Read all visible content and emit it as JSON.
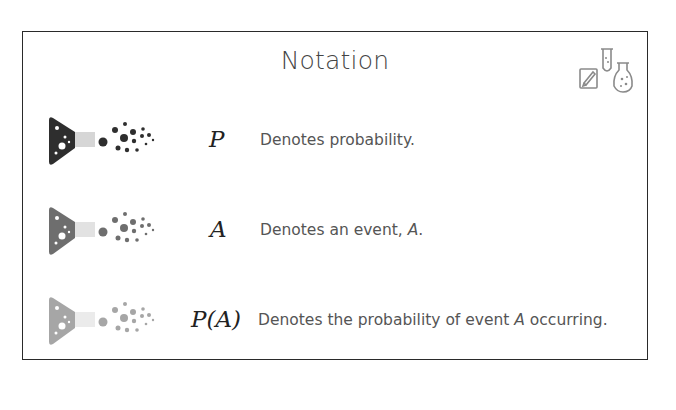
{
  "title": "Notation",
  "corner_icon": "pencil-testtube-flask-icon",
  "rows": [
    {
      "symbol": "P",
      "description": "Denotes probability.",
      "icon": "flask-particles-icon",
      "shade": "#2e2e2e",
      "neck": "#d6d6d6"
    },
    {
      "symbol": "A",
      "description_prefix": "Denotes an event, ",
      "description_var": "A",
      "description_suffix": ".",
      "icon": "flask-particles-icon",
      "shade": "#6e6e6e",
      "neck": "#e2e2e2"
    },
    {
      "symbol": "P(A)",
      "description_prefix": "Denotes the probability of event ",
      "description_var": "A",
      "description_suffix": " occurring.",
      "icon": "flask-particles-icon",
      "shade": "#a6a6a6",
      "neck": "#ebebeb"
    }
  ]
}
